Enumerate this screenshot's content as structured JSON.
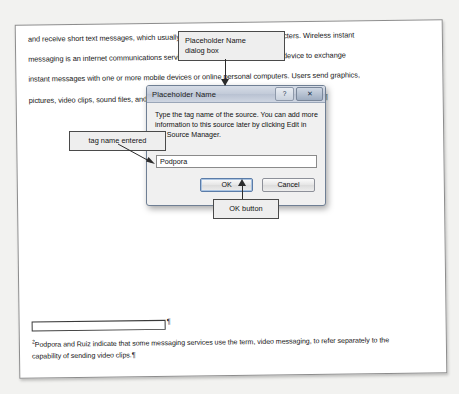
{
  "document": {
    "body_lines": [
      "and receive short text messages, which usually consist of fewer than 300 characters. Wireless instant",
      "messaging is an internet communications service that allows a wireless mobile device to exchange",
      "instant messages with one or more mobile devices or online personal computers. Users send graphics,",
      "pictures, video clips, sound files, and short text messages with picture messaging services."
    ],
    "line4_footnote_ref": "2",
    "pilcrow": "¶",
    "footnote": {
      "separator_mark": "¶",
      "reference": "2",
      "lines": [
        "Podpora and Ruiz indicate that some messaging services use the term, video messaging, to refer separately to the",
        "capability of sending video clips."
      ]
    }
  },
  "dialog": {
    "title": "Placeholder Name",
    "help_button_glyph": "?",
    "close_button_glyph": "✕",
    "message": "Type the tag name of the source. You can add more information to this source later by clicking Edit in the Source Manager.",
    "input_value": "Podpora",
    "input_placeholder": "",
    "ok_label": "OK",
    "cancel_label": "Cancel"
  },
  "annotations": {
    "dialog_box": "Placeholder Name\ndialog box",
    "tag_name_entered": "tag name entered",
    "ok_button": "OK button"
  },
  "colors": {
    "page": "#ffffff",
    "canvas": "#f2f2f0",
    "callout_fill": "#eeeeee",
    "callout_border": "#4a4a4a",
    "dialog_face": "#f0f0f0",
    "title_bar": "#c3cbd9"
  }
}
